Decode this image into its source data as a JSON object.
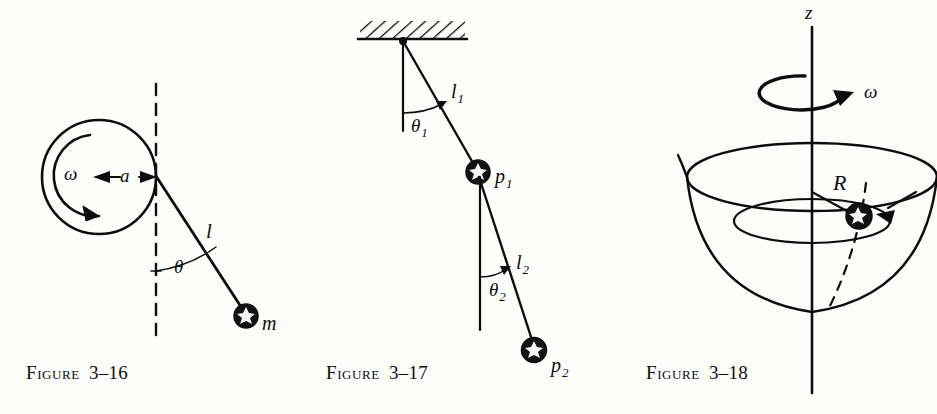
{
  "page": {
    "background_color": "#fdfdfc",
    "ink_color": "#0d0d0d",
    "figure_count": 3
  },
  "figures": [
    {
      "id": "figure-3-16",
      "caption_word": "Figure",
      "caption_number": "3–16",
      "description": "Pendulum of length l attached to the rim of a rotating wheel of radius a spinning with angular velocity omega; bob of mass m hangs at angle theta from the vertical dashed line.",
      "labels": {
        "omega": "ω",
        "radius": "a",
        "length": "l",
        "angle": "θ",
        "mass": "m"
      }
    },
    {
      "id": "figure-3-17",
      "caption_word": "Figure",
      "caption_number": "3–17",
      "description": "Double pendulum suspended from a hatched ceiling: upper rod l1 at angle theta1 to bob p1, lower rod l2 at angle theta2 to bob p2.",
      "labels": {
        "upper_length": "l",
        "upper_length_sub": "1",
        "upper_angle": "θ",
        "upper_angle_sub": "1",
        "upper_bob": "p",
        "upper_bob_sub": "1",
        "lower_length": "l",
        "lower_length_sub": "2",
        "lower_angle": "θ",
        "lower_angle_sub": "2",
        "lower_bob": "p",
        "lower_bob_sub": "2"
      }
    },
    {
      "id": "figure-3-18",
      "caption_word": "Figure",
      "caption_number": "3–18",
      "description": "Bead sliding on the inside of a paraboloid of revolution rotating about the vertical z axis with angular velocity omega at orbit radius R.",
      "labels": {
        "axis": "z",
        "omega": "ω",
        "radius": "R"
      }
    }
  ]
}
